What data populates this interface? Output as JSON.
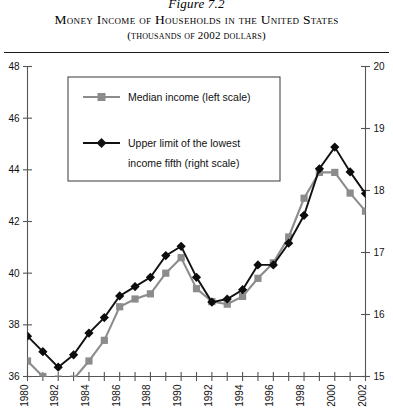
{
  "header": {
    "figure_number": "Figure 7.2",
    "title": "Money Income of Households in the United States",
    "subtitle": "(thousands of 2002 dollars)"
  },
  "legend": {
    "items": [
      {
        "label": "Median income (left scale)",
        "color": "#8c8c8c",
        "marker": "square"
      },
      {
        "label": "Upper limit of the lowest",
        "label2": "income fifth (right scale)",
        "color": "#111111",
        "marker": "diamond"
      }
    ]
  },
  "axes": {
    "left": {
      "ticks": [
        "36",
        "38",
        "40",
        "42",
        "44",
        "46",
        "48"
      ],
      "min": 36,
      "max": 48
    },
    "right": {
      "ticks": [
        "15",
        "16",
        "17",
        "18",
        "19",
        "20"
      ],
      "min": 15,
      "max": 20
    },
    "x": {
      "labels": [
        "1980",
        "1982",
        "1984",
        "1986",
        "1988",
        "1990",
        "1992",
        "1994",
        "1996",
        "1998",
        "2000",
        "2002"
      ],
      "min": 1980,
      "max": 2002
    }
  },
  "chart_data": {
    "type": "line",
    "title": "Money Income of Households in the United States",
    "subtitle": "(thousands of 2002 dollars)",
    "xlabel": "",
    "ylabel": "",
    "ylabel_right": "",
    "grid": false,
    "legend_position": "upper-left-inset",
    "x": [
      1980,
      1981,
      1982,
      1983,
      1984,
      1985,
      1986,
      1987,
      1988,
      1989,
      1990,
      1991,
      1992,
      1993,
      1994,
      1995,
      1996,
      1997,
      1998,
      1999,
      2000,
      2001,
      2002
    ],
    "xtick_labels": [
      "1980",
      "1982",
      "1984",
      "1986",
      "1988",
      "1990",
      "1992",
      "1994",
      "1996",
      "1998",
      "2000",
      "2002"
    ],
    "series": [
      {
        "name": "Median income (left scale)",
        "axis": "left",
        "color": "#8c8c8c",
        "marker": "square",
        "ylim": [
          36,
          48
        ],
        "values": [
          36.6,
          36.0,
          35.9,
          35.9,
          36.6,
          37.4,
          38.7,
          39.0,
          39.2,
          40.0,
          40.6,
          39.4,
          38.9,
          38.8,
          39.1,
          39.8,
          40.4,
          41.4,
          42.9,
          43.9,
          43.9,
          43.1,
          42.4
        ]
      },
      {
        "name": "Upper limit of the lowest income fifth (right scale)",
        "axis": "right",
        "color": "#111111",
        "marker": "diamond",
        "ylim": [
          15,
          20
        ],
        "values": [
          15.65,
          15.4,
          15.15,
          15.35,
          15.7,
          15.95,
          16.3,
          16.45,
          16.6,
          16.95,
          17.1,
          16.6,
          16.2,
          16.25,
          16.4,
          16.8,
          16.8,
          17.15,
          17.6,
          18.35,
          18.7,
          18.3,
          17.95
        ]
      }
    ]
  }
}
